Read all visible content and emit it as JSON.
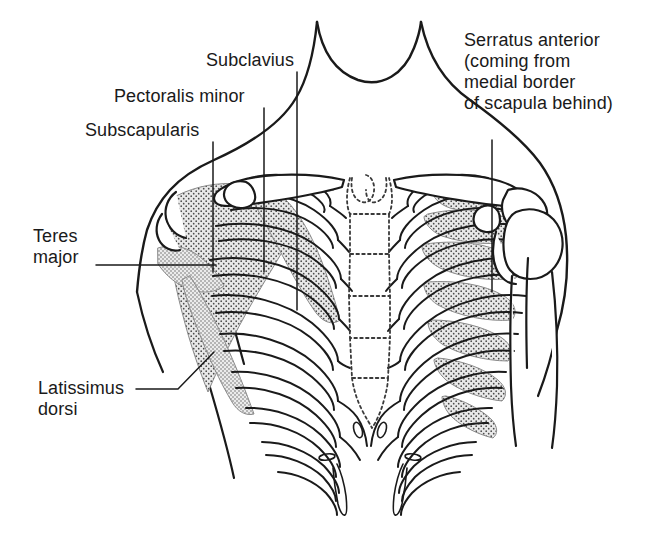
{
  "figure": {
    "background_color": "#ffffff",
    "ink_color": "#1a1a1a",
    "muscle_fill_color": "#e6e6e6",
    "muscle_stipple_color": "#4a4a4a",
    "bone_fill_color": "#ffffff"
  },
  "labels": [
    {
      "id": "subclavius",
      "text": "Subclavius",
      "x": 206,
      "y": 50,
      "leader": "vertical-line-down-to-clavicle"
    },
    {
      "id": "pectoralis-minor",
      "text": "Pectoralis minor",
      "x": 114,
      "y": 86,
      "leader": "vertical-line-down-to-pectoralis-minor-band"
    },
    {
      "id": "subscapularis",
      "text": "Subscapularis",
      "x": 85,
      "y": 120,
      "leader": "vertical-line-down-to-subscapularis-fan"
    },
    {
      "id": "serratus-anterior",
      "text": "Serratus anterior\n(coming from\nmedial border\nof scapula behind)",
      "x": 464,
      "y": 30,
      "leader": "vertical-line-down-to-serratus-digitations"
    },
    {
      "id": "teres-major",
      "text": "Teres\nmajor",
      "x": 33,
      "y": 226,
      "leader": "horizontal-line-right-to-teres-major"
    },
    {
      "id": "latissimus-dorsi",
      "text": "Latissimus\ndorsi",
      "x": 38,
      "y": 378,
      "leader": "elbowed-line-up-right-to-latissimus-dorsi"
    }
  ],
  "anatomy": {
    "structures": [
      "neck",
      "torso-outline",
      "clavicle-left",
      "clavicle-right",
      "sternum-manubrium",
      "sternum-body",
      "xiphoid-process",
      "ribs-1-to-10",
      "costal-cartilages",
      "scapula-left",
      "acromion-right",
      "humerus-right",
      "subscapularis-muscle",
      "pectoralis-minor-muscle",
      "subclavius-muscle",
      "serratus-anterior-muscle",
      "teres-major-muscle",
      "latissimus-dorsi-muscle"
    ]
  }
}
